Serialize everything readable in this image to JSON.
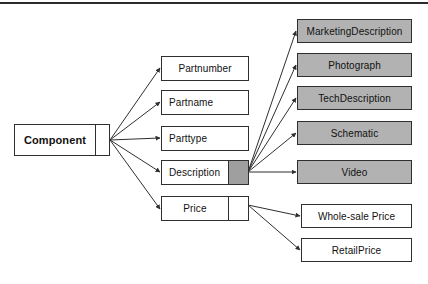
{
  "diagram": {
    "colors": {
      "shaded_fill": "#b2b2b2",
      "subcell_fill": "#9f9f9f",
      "stroke": "#2f2f2f",
      "rule": "#2b2b2b",
      "background": "#ffffff"
    },
    "root": {
      "label": "Component",
      "has_subcell": true,
      "subcell_filled": false
    },
    "attributes": [
      {
        "label": "Partnumber",
        "has_subcell": false,
        "subcell_filled": false,
        "align": "center"
      },
      {
        "label": "Partname",
        "has_subcell": false,
        "subcell_filled": false,
        "align": "left"
      },
      {
        "label": "Parttype",
        "has_subcell": false,
        "subcell_filled": false,
        "align": "left"
      },
      {
        "label": "Description",
        "has_subcell": true,
        "subcell_filled": true,
        "align": "left"
      },
      {
        "label": "Price",
        "has_subcell": true,
        "subcell_filled": false,
        "align": "center"
      }
    ],
    "description_children": [
      {
        "label": "MarketingDescription",
        "shaded": true
      },
      {
        "label": "Photograph",
        "shaded": true
      },
      {
        "label": "TechDescription",
        "shaded": true
      },
      {
        "label": "Schematic",
        "shaded": true
      },
      {
        "label": "Video",
        "shaded": true
      }
    ],
    "price_children": [
      {
        "label": "Whole-sale Price",
        "shaded": false
      },
      {
        "label": "RetailPrice",
        "shaded": false
      }
    ]
  }
}
